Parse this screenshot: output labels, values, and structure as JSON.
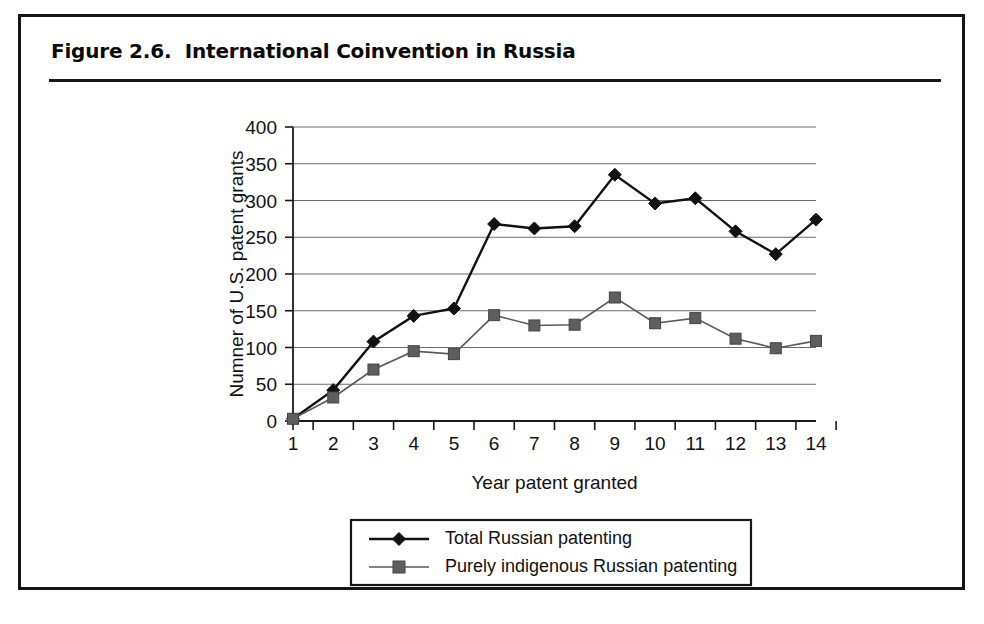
{
  "figure": {
    "title": "Figure 2.6.  International Coinvention in Russia"
  },
  "chart_data": {
    "type": "line",
    "title": "Figure 2.6.  International Coinvention in Russia",
    "xlabel": "Year patent granted",
    "ylabel": "Numner of U.S. patent grants",
    "x": [
      1,
      2,
      3,
      4,
      5,
      6,
      7,
      8,
      9,
      10,
      11,
      12,
      13,
      14
    ],
    "xtick_labels": [
      "1",
      "2",
      "3",
      "4",
      "5",
      "6",
      "7",
      "8",
      "9",
      "10",
      "11",
      "12",
      "13",
      "14"
    ],
    "ytick_labels": [
      "0",
      "50",
      "100",
      "150",
      "200",
      "250",
      "300",
      "350",
      "400"
    ],
    "yticks": [
      0,
      50,
      100,
      150,
      200,
      250,
      300,
      350,
      400
    ],
    "ylim": [
      0,
      400
    ],
    "xlim": [
      1,
      14
    ],
    "grid": true,
    "legend_position": "below-plot",
    "series": [
      {
        "name": "Total Russian patenting",
        "marker": "diamond",
        "color": "#111111",
        "values": [
          3,
          42,
          108,
          143,
          153,
          268,
          262,
          265,
          335,
          296,
          303,
          258,
          227,
          274
        ]
      },
      {
        "name": "Purely indigenous Russian patenting",
        "marker": "square",
        "color": "#5e5e5e",
        "values": [
          3,
          32,
          70,
          95,
          91,
          144,
          130,
          131,
          168,
          133,
          140,
          112,
          99,
          109
        ]
      }
    ]
  }
}
